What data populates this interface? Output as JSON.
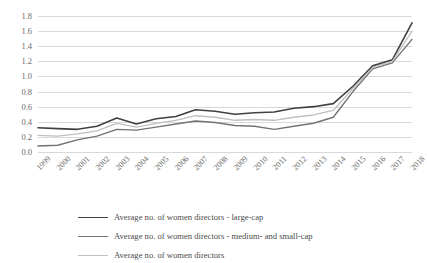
{
  "chart_data": {
    "type": "line",
    "title": "",
    "xlabel": "",
    "ylabel": "",
    "x": [
      1999,
      2000,
      2001,
      2002,
      2003,
      2004,
      2005,
      2006,
      2007,
      2008,
      2009,
      2010,
      2011,
      2012,
      2013,
      2014,
      2015,
      2016,
      2017,
      2018
    ],
    "categories": [
      "1999",
      "2000",
      "2001",
      "2002",
      "2003",
      "2004",
      "2005",
      "2006",
      "2007",
      "2008",
      "2009",
      "2010",
      "2011",
      "2012",
      "2013",
      "2014",
      "2015",
      "2016",
      "2017",
      "2018"
    ],
    "ylim": [
      0.0,
      1.8
    ],
    "ytick_values": [
      0.0,
      0.2,
      0.4,
      0.6,
      0.8,
      1.0,
      1.2,
      1.4,
      1.6,
      1.8
    ],
    "ytick_labels": [
      "0.0",
      "0.2",
      "0.4",
      "0.6",
      "0.8",
      "1.0",
      "1.2",
      "1.4",
      "1.6",
      "1.8"
    ],
    "grid": "horizontal",
    "legend_position": "bottom",
    "series": [
      {
        "name": "Average no. of women directors - large-cap",
        "color": "#404040",
        "width": 1.6,
        "values": [
          0.32,
          0.31,
          0.3,
          0.34,
          0.45,
          0.37,
          0.44,
          0.47,
          0.56,
          0.54,
          0.5,
          0.52,
          0.53,
          0.58,
          0.6,
          0.64,
          0.87,
          1.14,
          1.22,
          1.71
        ]
      },
      {
        "name": "Average no. of women directors - medium- and small-cap",
        "color": "#737373",
        "width": 1.4,
        "values": [
          0.08,
          0.09,
          0.16,
          0.21,
          0.3,
          0.29,
          0.33,
          0.37,
          0.41,
          0.39,
          0.35,
          0.34,
          0.3,
          0.34,
          0.38,
          0.46,
          0.8,
          1.1,
          1.18,
          1.49
        ]
      },
      {
        "name": "Average no. of women directors",
        "color": "#bfbfbf",
        "width": 1.3,
        "values": [
          0.22,
          0.21,
          0.24,
          0.28,
          0.38,
          0.33,
          0.38,
          0.42,
          0.48,
          0.46,
          0.42,
          0.43,
          0.42,
          0.46,
          0.49,
          0.55,
          0.84,
          1.12,
          1.2,
          1.6
        ]
      }
    ]
  },
  "legend": {
    "items": [
      {
        "label": "Average no. of women directors - large-cap"
      },
      {
        "label": "Average no. of women directors - medium- and small-cap"
      },
      {
        "label": "Average no. of women directors"
      }
    ]
  }
}
